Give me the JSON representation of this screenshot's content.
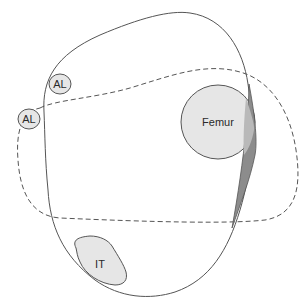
{
  "diagram": {
    "labels": {
      "al_upper": "AL",
      "al_lower": "AL",
      "femur": "Femur",
      "it": "IT"
    },
    "colors": {
      "outline": "#555555",
      "label_fill": "#e6e6e6",
      "sliver_fill": "#8c8c8c",
      "sliver_overlap_fill": "#b9b9b9",
      "dashed": "#555555"
    },
    "legend": {
      "solid_outline": "solid outline shape",
      "dashed_outline": "dashed outline shape"
    }
  }
}
